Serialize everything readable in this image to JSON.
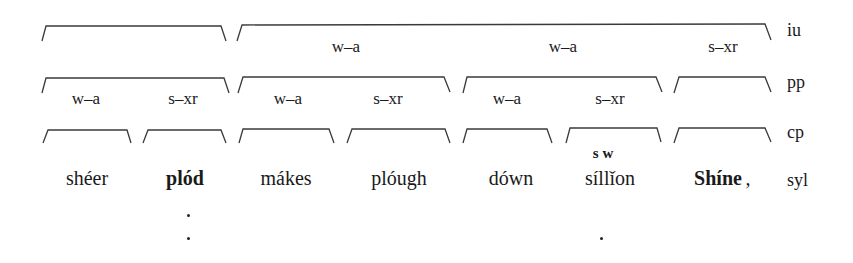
{
  "tiers": {
    "iu": "iu",
    "pp": "pp",
    "cp": "cp",
    "syl": "syl"
  },
  "iu_row": {
    "labels": [
      {
        "text": "w–a",
        "x": 346
      },
      {
        "text": "w–a",
        "x": 563
      },
      {
        "text": "s–xr",
        "x": 723
      }
    ]
  },
  "pp_row": {
    "labels": [
      {
        "text": "w–a",
        "x": 86
      },
      {
        "text": "s–xr",
        "x": 183
      },
      {
        "text": "w–a",
        "x": 288
      },
      {
        "text": "s–xr",
        "x": 388
      },
      {
        "text": "w–a",
        "x": 507
      },
      {
        "text": "s–xr",
        "x": 610
      }
    ]
  },
  "cp_row": {
    "sillion_stress": "s  w"
  },
  "words": [
    {
      "text": "shéer",
      "bold": false,
      "x": 87
    },
    {
      "text": "plód",
      "bold": true,
      "x": 185
    },
    {
      "text": "mákes",
      "bold": false,
      "x": 286
    },
    {
      "text": "plóugh",
      "bold": false,
      "x": 399
    },
    {
      "text": "dówn",
      "bold": false,
      "x": 511
    },
    {
      "text": "síllǐon",
      "bold": false,
      "x": 610
    },
    {
      "text": "Shíne",
      "bold": true,
      "x": 718
    },
    {
      "text": ",",
      "bold": false,
      "x": 746
    }
  ]
}
